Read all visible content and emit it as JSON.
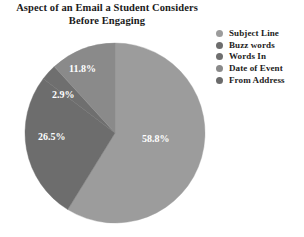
{
  "title": {
    "line1": "Aspect of an Email a Student Considers",
    "line2": "Before Engaging"
  },
  "legend": {
    "items": [
      {
        "label": "Subject Line",
        "color": "#9c9c9c"
      },
      {
        "label": "Buzz words",
        "color": "#6d6d6d"
      },
      {
        "label": "Words In",
        "color": "#6f6f6f"
      },
      {
        "label": "Date of Event",
        "color": "#8a8a8a"
      },
      {
        "label": "From Address",
        "color": "#6b6b6b"
      }
    ]
  },
  "chart_data": {
    "type": "pie",
    "title": "Aspect of an Email a Student Considers Before Engaging",
    "legend_position": "right",
    "start_angle_deg": 0,
    "direction": "clockwise",
    "categories": [
      "Subject Line",
      "Buzz words",
      "Words In",
      "Date of Event",
      "From Address"
    ],
    "values": [
      58.8,
      26.5,
      2.9,
      11.8,
      0
    ],
    "value_labels": [
      "58.8%",
      "26.5%",
      "2.9%",
      "11.8%",
      ""
    ],
    "colors": [
      "#9c9c9c",
      "#6d6d6d",
      "#6f6f6f",
      "#8a8a8a",
      "#6b6b6b"
    ],
    "units": "percent",
    "slices": [
      {
        "name": "Subject Line",
        "value": 58.8,
        "label": "58.8%",
        "color": "#9c9c9c",
        "label_x": 118,
        "label_y": 100
      },
      {
        "name": "Buzz words",
        "value": 26.5,
        "label": "26.5%",
        "color": "#6d6d6d",
        "label_x": 14,
        "label_y": 98
      },
      {
        "name": "Words In",
        "value": 2.9,
        "label": "2.9%",
        "color": "#6f6f6f",
        "label_x": 28,
        "label_y": 56
      },
      {
        "name": "Date of Event",
        "value": 11.8,
        "label": "11.8%",
        "color": "#8a8a8a",
        "label_x": 45,
        "label_y": 30
      },
      {
        "name": "From Address",
        "value": 0,
        "label": "",
        "color": "#6b6b6b",
        "label_x": 0,
        "label_y": 0
      }
    ]
  }
}
